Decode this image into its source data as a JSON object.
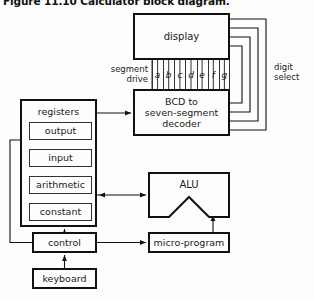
{
  "figure": {
    "title": "Figure 11.10 Calculator block diagram."
  },
  "blocks": {
    "display": {
      "label": "display"
    },
    "decoder": {
      "line1": "BCD to",
      "line2": "seven-segment",
      "line3": "decoder"
    },
    "registers": {
      "title": "registers",
      "items": [
        {
          "label": "output"
        },
        {
          "label": "input"
        },
        {
          "label": "arithmetic"
        },
        {
          "label": "constant"
        }
      ]
    },
    "alu": {
      "label": "ALU"
    },
    "control": {
      "label": "control"
    },
    "keyboard": {
      "label": "keyboard"
    },
    "microprogram": {
      "label": "micro-program"
    }
  },
  "labels": {
    "segment_drive": {
      "line1": "segment",
      "line2": "drive"
    },
    "digit_select": {
      "line1": "digit",
      "line2": "select"
    }
  },
  "segment_lines": [
    {
      "letter": "a"
    },
    {
      "letter": "b"
    },
    {
      "letter": "c"
    },
    {
      "letter": "d"
    },
    {
      "letter": "e"
    },
    {
      "letter": "f"
    },
    {
      "letter": "g"
    }
  ],
  "colors": {
    "background": "#fdfdfd",
    "stroke": "#111111",
    "stroke_thin": "#333333",
    "text": "#1a1a1a"
  }
}
